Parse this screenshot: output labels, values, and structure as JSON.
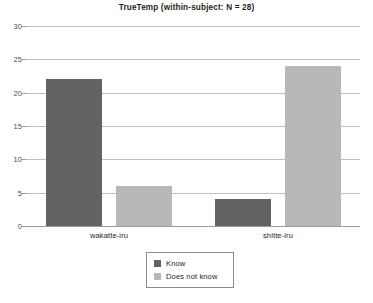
{
  "chart_data": {
    "type": "bar",
    "title": "TrueTemp (within-subject: N = 28)",
    "xlabel": "",
    "ylabel": "",
    "categories": [
      "wakatte-iru",
      "shitte-iru"
    ],
    "series": [
      {
        "name": "Know",
        "color": "#636363",
        "values": [
          22,
          4
        ]
      },
      {
        "name": "Does not know",
        "color": "#b8b8b8",
        "values": [
          6,
          24
        ]
      }
    ],
    "ylim": [
      0,
      30
    ],
    "yticks": [
      0,
      5,
      10,
      15,
      20,
      25,
      30
    ],
    "ytick_labels": [
      "0",
      "5",
      "10",
      "15",
      "20",
      "25",
      "30"
    ],
    "grid": true,
    "legend_position": "bottom-center",
    "background": "#ffffff"
  },
  "legend": {
    "entries": [
      {
        "label": "Know",
        "swatch": "#636363"
      },
      {
        "label": "Does not know",
        "swatch": "#b8b8b8"
      }
    ]
  }
}
